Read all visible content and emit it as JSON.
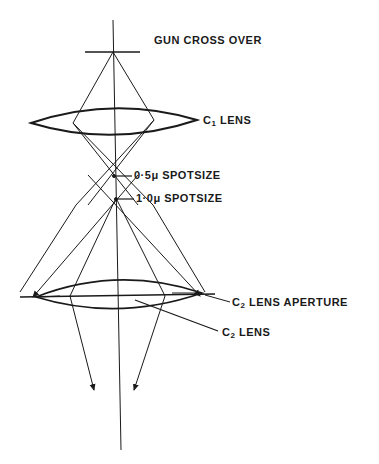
{
  "diagram": {
    "type": "electron optics ray diagram",
    "labels": {
      "gun": "GUN CROSS OVER",
      "c1": "C",
      "c1_sub": "1",
      "c1_rest": " LENS",
      "spot05": "0·5μ  SPOTSIZE",
      "spot10": "1·0μ  SPOTSIZE",
      "c2ap": "C",
      "c2ap_sub": "2",
      "c2ap_rest": " LENS   APERTURE",
      "c2": "C",
      "c2_sub": "2",
      "c2_rest": " LENS"
    },
    "colors": {
      "line": "#1a1a1a",
      "background": "#ffffff"
    }
  }
}
